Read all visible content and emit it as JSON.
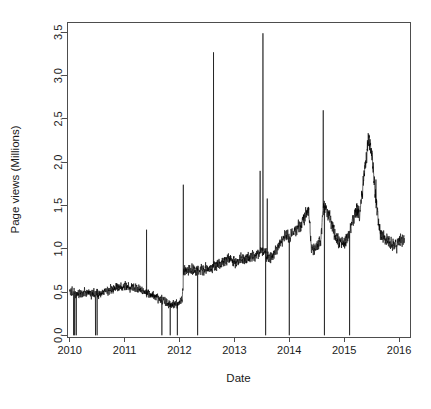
{
  "figure": {
    "width": 431,
    "height": 409,
    "background": "#ffffff",
    "plot_box": {
      "left": 67,
      "top": 22,
      "right": 410,
      "bottom": 337
    },
    "line_color": "#000000",
    "axis_color": "#4d4d4d",
    "text_color": "#1a1a1a"
  },
  "chart_data": {
    "type": "line",
    "title": "",
    "subtitle": "",
    "xlabel": "Date",
    "ylabel": "Page views (Millions)",
    "xlim": [
      2009.95,
      2016.2
    ],
    "ylim": [
      -0.02,
      3.62
    ],
    "xticks": [
      2010,
      2011,
      2012,
      2013,
      2014,
      2015,
      2016
    ],
    "xticklabels": [
      "2010",
      "2011",
      "2012",
      "2013",
      "2014",
      "2015",
      "2016"
    ],
    "yticks": [
      0.0,
      0.5,
      1.0,
      1.5,
      2.0,
      2.5,
      3.0,
      3.5
    ],
    "yticklabels": [
      "0.0",
      "0.5",
      "1.0",
      "1.5",
      "2.0",
      "2.5",
      "3.0",
      "3.5"
    ],
    "grid": false,
    "legend": null,
    "series": [
      {
        "name": "Page views",
        "color": "#000000",
        "units": "Millions",
        "description": "Daily page views, noisy high-frequency trace with service-outage drops to 0 and occasional traffic spikes.",
        "baseline": [
          {
            "x": 2010.0,
            "y": 0.5
          },
          {
            "x": 2010.1,
            "y": 0.49
          },
          {
            "x": 2010.2,
            "y": 0.48
          },
          {
            "x": 2010.3,
            "y": 0.49
          },
          {
            "x": 2010.4,
            "y": 0.49
          },
          {
            "x": 2010.5,
            "y": 0.47
          },
          {
            "x": 2010.6,
            "y": 0.5
          },
          {
            "x": 2010.7,
            "y": 0.52
          },
          {
            "x": 2010.8,
            "y": 0.54
          },
          {
            "x": 2010.9,
            "y": 0.55
          },
          {
            "x": 2011.0,
            "y": 0.56
          },
          {
            "x": 2011.1,
            "y": 0.55
          },
          {
            "x": 2011.2,
            "y": 0.54
          },
          {
            "x": 2011.3,
            "y": 0.52
          },
          {
            "x": 2011.4,
            "y": 0.49
          },
          {
            "x": 2011.5,
            "y": 0.46
          },
          {
            "x": 2011.6,
            "y": 0.43
          },
          {
            "x": 2011.7,
            "y": 0.4
          },
          {
            "x": 2011.8,
            "y": 0.37
          },
          {
            "x": 2011.9,
            "y": 0.35
          },
          {
            "x": 2011.98,
            "y": 0.36
          },
          {
            "x": 2012.05,
            "y": 0.4
          },
          {
            "x": 2012.08,
            "y": 0.74
          },
          {
            "x": 2012.15,
            "y": 0.76
          },
          {
            "x": 2012.25,
            "y": 0.74
          },
          {
            "x": 2012.35,
            "y": 0.73
          },
          {
            "x": 2012.45,
            "y": 0.76
          },
          {
            "x": 2012.55,
            "y": 0.78
          },
          {
            "x": 2012.65,
            "y": 0.8
          },
          {
            "x": 2012.75,
            "y": 0.83
          },
          {
            "x": 2012.85,
            "y": 0.88
          },
          {
            "x": 2012.95,
            "y": 0.86
          },
          {
            "x": 2013.05,
            "y": 0.85
          },
          {
            "x": 2013.15,
            "y": 0.87
          },
          {
            "x": 2013.25,
            "y": 0.88
          },
          {
            "x": 2013.35,
            "y": 0.92
          },
          {
            "x": 2013.45,
            "y": 0.96
          },
          {
            "x": 2013.55,
            "y": 0.98
          },
          {
            "x": 2013.62,
            "y": 0.88
          },
          {
            "x": 2013.7,
            "y": 0.92
          },
          {
            "x": 2013.8,
            "y": 1.02
          },
          {
            "x": 2013.88,
            "y": 1.12
          },
          {
            "x": 2013.95,
            "y": 1.18
          },
          {
            "x": 2014.02,
            "y": 1.12
          },
          {
            "x": 2014.1,
            "y": 1.2
          },
          {
            "x": 2014.2,
            "y": 1.28
          },
          {
            "x": 2014.3,
            "y": 1.36
          },
          {
            "x": 2014.36,
            "y": 1.42
          },
          {
            "x": 2014.4,
            "y": 0.97
          },
          {
            "x": 2014.5,
            "y": 1.02
          },
          {
            "x": 2014.58,
            "y": 1.12
          },
          {
            "x": 2014.62,
            "y": 1.52
          },
          {
            "x": 2014.68,
            "y": 1.46
          },
          {
            "x": 2014.75,
            "y": 1.34
          },
          {
            "x": 2014.82,
            "y": 1.18
          },
          {
            "x": 2014.9,
            "y": 1.06
          },
          {
            "x": 2015.0,
            "y": 1.08
          },
          {
            "x": 2015.08,
            "y": 1.14
          },
          {
            "x": 2015.15,
            "y": 1.28
          },
          {
            "x": 2015.22,
            "y": 1.46
          },
          {
            "x": 2015.28,
            "y": 1.38
          },
          {
            "x": 2015.34,
            "y": 1.74
          },
          {
            "x": 2015.4,
            "y": 2.05
          },
          {
            "x": 2015.45,
            "y": 2.28
          },
          {
            "x": 2015.5,
            "y": 2.12
          },
          {
            "x": 2015.55,
            "y": 1.78
          },
          {
            "x": 2015.6,
            "y": 1.42
          },
          {
            "x": 2015.66,
            "y": 1.18
          },
          {
            "x": 2015.72,
            "y": 1.12
          },
          {
            "x": 2015.8,
            "y": 1.08
          },
          {
            "x": 2015.88,
            "y": 1.06
          },
          {
            "x": 2015.95,
            "y": 1.04
          },
          {
            "x": 2016.02,
            "y": 1.1
          },
          {
            "x": 2016.08,
            "y": 1.12
          }
        ],
        "up_spikes": [
          {
            "x": 2011.4,
            "y": 1.22
          },
          {
            "x": 2012.07,
            "y": 1.74
          },
          {
            "x": 2012.62,
            "y": 3.27
          },
          {
            "x": 2013.47,
            "y": 1.9
          },
          {
            "x": 2013.52,
            "y": 3.49
          },
          {
            "x": 2013.6,
            "y": 1.58
          },
          {
            "x": 2014.62,
            "y": 2.6
          },
          {
            "x": 2015.58,
            "y": 1.8
          }
        ],
        "down_spikes": [
          {
            "x": 2010.07,
            "y": 0.0
          },
          {
            "x": 2010.09,
            "y": 0.0
          },
          {
            "x": 2010.12,
            "y": 0.0
          },
          {
            "x": 2010.47,
            "y": 0.0
          },
          {
            "x": 2010.5,
            "y": 0.0
          },
          {
            "x": 2011.68,
            "y": 0.0
          },
          {
            "x": 2011.83,
            "y": 0.0
          },
          {
            "x": 2011.96,
            "y": 0.0
          },
          {
            "x": 2012.33,
            "y": 0.0
          },
          {
            "x": 2013.57,
            "y": 0.0
          },
          {
            "x": 2014.0,
            "y": 0.0
          },
          {
            "x": 2014.64,
            "y": 0.0
          },
          {
            "x": 2015.1,
            "y": 0.0
          }
        ],
        "noise_amplitude": 0.055,
        "value_range": [
          0.0,
          3.49
        ],
        "annotations": []
      }
    ]
  }
}
